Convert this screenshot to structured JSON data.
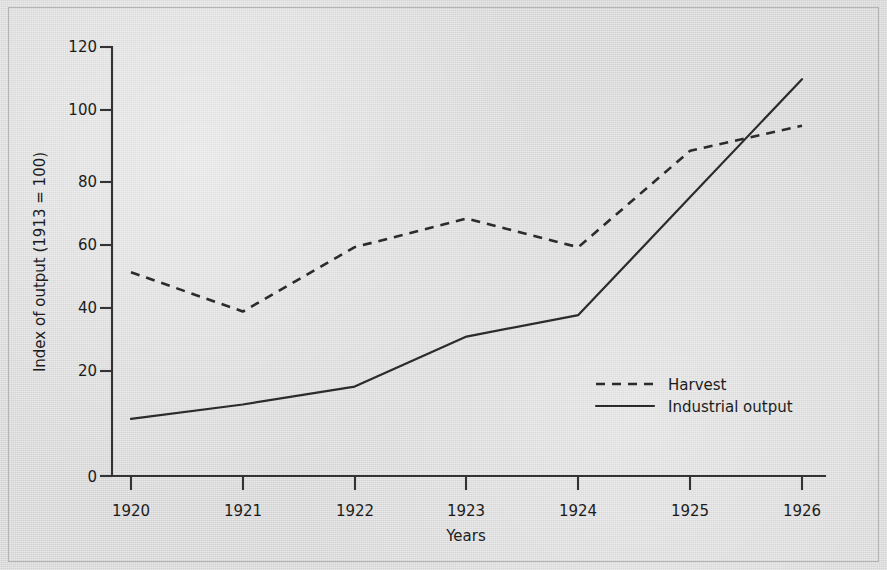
{
  "chart_data": {
    "type": "line",
    "title": "",
    "xlabel": "Years",
    "ylabel": "Index of output (1913 = 100)",
    "x": [
      1920,
      1921,
      1922,
      1923,
      1924,
      1925,
      1926
    ],
    "xticklabels": [
      "1920",
      "1921",
      "1922",
      "1923",
      "1924",
      "1925",
      "1926"
    ],
    "yticks": [
      0,
      20,
      40,
      60,
      80,
      100,
      120
    ],
    "yticklabels": [
      "0",
      "20",
      "40",
      "60",
      "80",
      "100",
      "120"
    ],
    "ylim": [
      0,
      120
    ],
    "xlim": [
      1920,
      1926
    ],
    "grid": false,
    "legend_position": "center-right-inside",
    "series": [
      {
        "name": "Harvest",
        "style": "dashed",
        "color": "#2b2b2b",
        "values": [
          57,
          46,
          64,
          72,
          64,
          91,
          98
        ]
      },
      {
        "name": "Industrial output",
        "style": "solid",
        "color": "#2b2b2b",
        "values": [
          16,
          20,
          25,
          39,
          45,
          78,
          111
        ]
      }
    ]
  },
  "axes": {
    "y_label": "Index of output (1913 = 100)",
    "x_label": "Years",
    "y_tick_labels": [
      "120",
      "100",
      "80",
      "60",
      "40",
      "20",
      "0"
    ],
    "x_tick_labels": [
      "1920",
      "1921",
      "1922",
      "1923",
      "1924",
      "1925",
      "1926"
    ]
  },
  "legend": {
    "items": [
      {
        "label": "Harvest",
        "style": "dashed"
      },
      {
        "label": "Industrial output",
        "style": "solid"
      }
    ]
  },
  "colors": {
    "paper": "#d9d9d9",
    "ink": "#2b2b2b",
    "axis": "#333333",
    "frame": "#b4b4b4"
  }
}
